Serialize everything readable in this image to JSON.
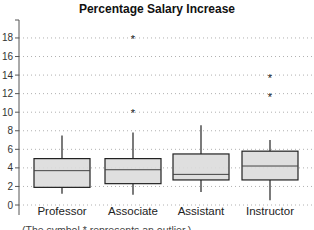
{
  "chart_data": {
    "type": "boxplot",
    "title": "Percentage Salary Increase",
    "xlabel": "",
    "ylabel": "",
    "ylim": [
      -1,
      19.5
    ],
    "yticks": [
      0,
      2,
      4,
      6,
      8,
      10,
      12,
      14,
      16,
      18
    ],
    "grid": "horizontal dotted",
    "legend": null,
    "categories": [
      "Professor",
      "Associate",
      "Assistant",
      "Instructor"
    ],
    "series": [
      {
        "name": "Professor",
        "whisker_low": 1.2,
        "q1": 1.9,
        "median": 3.7,
        "q3": 5.0,
        "whisker_high": 7.5,
        "outliers": []
      },
      {
        "name": "Associate",
        "whisker_low": 1.1,
        "q1": 2.3,
        "median": 3.8,
        "q3": 5.0,
        "whisker_high": 7.8,
        "outliers": [
          10.0,
          18.0
        ]
      },
      {
        "name": "Assistant",
        "whisker_low": 1.4,
        "q1": 2.7,
        "median": 3.3,
        "q3": 5.5,
        "whisker_high": 8.6,
        "outliers": []
      },
      {
        "name": "Instructor",
        "whisker_low": 0.5,
        "q1": 2.7,
        "median": 4.2,
        "q3": 5.8,
        "whisker_high": 7.0,
        "outliers": [
          11.7,
          13.8
        ]
      }
    ],
    "annotation": "(The symbol * represents an outlier.)",
    "colors": {
      "box_fill": "#dcdcdc",
      "box_stroke": "#222222",
      "grid": "#b0b0b0"
    }
  }
}
